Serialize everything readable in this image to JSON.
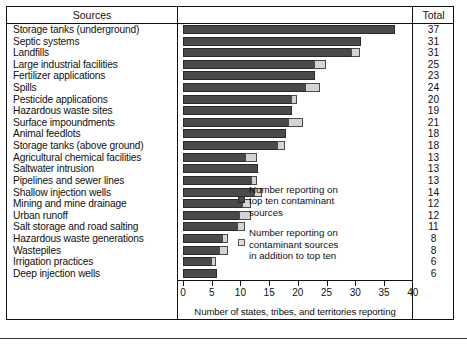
{
  "table": {
    "header_sources": "Sources",
    "header_total": "Total"
  },
  "legend": {
    "dark": {
      "line1": "Number reporting on",
      "line2": "top ten contaminant",
      "line3": "sources",
      "swatch_color": "#4a4a4a"
    },
    "light": {
      "line1": "Number reporting on",
      "line2": "contaminant sources",
      "line3": "in  addition to top ten",
      "swatch_color": "#dedede"
    }
  },
  "chart_data": {
    "type": "bar",
    "orientation": "horizontal",
    "stacked": true,
    "title": "",
    "xlabel": "Number of states, tribes, and territories reporting",
    "ylabel": "Sources",
    "xlim": [
      0,
      40
    ],
    "xticks": [
      0,
      5,
      10,
      15,
      20,
      25,
      30,
      35
    ],
    "grid": false,
    "legend_position": "inside-right",
    "series": [
      {
        "name": "Number reporting on top ten contaminant sources",
        "color": "#4a4a4a",
        "values": [
          37,
          31,
          29.5,
          23,
          23,
          21.5,
          19,
          19,
          18.5,
          18,
          16.5,
          11,
          13,
          12,
          12.5,
          10.5,
          10,
          9.5,
          7,
          6.5,
          5,
          6
        ]
      },
      {
        "name": "Number reporting on contaminant sources in addition to top ten",
        "color": "#dedede",
        "values": [
          0,
          0,
          1.5,
          2,
          0,
          2.5,
          1,
          0,
          2.5,
          0,
          1.5,
          2,
          0,
          1,
          1.5,
          1.5,
          2,
          1.5,
          1,
          1.5,
          1,
          0
        ]
      }
    ],
    "categories": [
      "Storage tanks (underground)",
      "Septic systems",
      "Landfills",
      "Large industrial facilities",
      "Fertilizer applications",
      "Spills",
      "Pesticide applications",
      "Hazardous waste sites",
      "Surface impoundments",
      "Animal feedlots",
      "Storage tanks (above ground)",
      "Agricultural chemical facilities",
      "Saltwater intrusion",
      "Pipelines and sewer lines",
      "Shallow injection wells",
      "Mining and mine drainage",
      "Urban runoff",
      "Salt storage and road salting",
      "Hazardous waste generations",
      "Wastepiles",
      "Irrigation practices",
      "Deep injection wells"
    ],
    "totals": [
      37,
      31,
      31,
      25,
      23,
      24,
      20,
      19,
      21,
      18,
      18,
      13,
      13,
      13,
      14,
      12,
      12,
      11,
      8,
      8,
      6,
      6
    ]
  }
}
